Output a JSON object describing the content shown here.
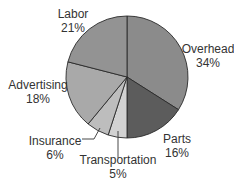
{
  "chart_data": {
    "type": "pie",
    "title": "",
    "categories": [
      "Overhead",
      "Parts",
      "Transportation",
      "Insurance",
      "Advertising",
      "Labor"
    ],
    "values": [
      34,
      16,
      5,
      6,
      18,
      21
    ],
    "unit": "%",
    "start_angle_deg": 0,
    "direction": "clockwise",
    "colors": [
      "#8b8b8b",
      "#5c5c5c",
      "#d2d2d2",
      "#bdbdbd",
      "#a9a9a9",
      "#939393"
    ],
    "center": [
      127,
      77
    ],
    "radius": 61,
    "labels": [
      {
        "name": "Overhead",
        "pct": "34%",
        "x": 208,
        "y": 42,
        "leader": null
      },
      {
        "name": "Parts",
        "pct": "16%",
        "x": 177,
        "y": 132,
        "leader": null
      },
      {
        "name": "Transportation",
        "pct": "5%",
        "x": 118,
        "y": 159,
        "leader": [
          [
            118,
            158
          ],
          [
            118,
            131
          ]
        ]
      },
      {
        "name": "Insurance",
        "pct": "6%",
        "x": 55,
        "y": 134,
        "leader": [
          [
            82,
            139
          ],
          [
            94,
            139
          ],
          [
            100,
            128
          ]
        ]
      },
      {
        "name": "Advertising",
        "pct": "18%",
        "x": 38,
        "y": 78,
        "leader": null
      },
      {
        "name": "Labor",
        "pct": "21%",
        "x": 73,
        "y": 7,
        "leader": null
      }
    ],
    "legend": "none"
  }
}
